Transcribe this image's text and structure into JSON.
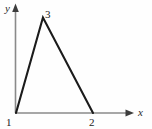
{
  "figure": {
    "background_color": "#fefefe",
    "axis_color": "#8a8a8a",
    "curve_color": "#1b1b1b",
    "label_color": "#222222",
    "axes": {
      "x_axis_label": "x",
      "y_axis_label": "y",
      "x_axis_arrow": "arrow-right",
      "y_axis_arrow": "arrow-up"
    },
    "point_labels": {
      "origin_label": "1",
      "peak_label": "3",
      "right_label": "2"
    }
  },
  "chart_data": {
    "type": "line",
    "title": "",
    "subtitle": "",
    "xlabel": "x",
    "ylabel": "y",
    "grid": false,
    "legend": null,
    "xlim": [
      1,
      2.55
    ],
    "ylim": [
      0,
      3.6
    ],
    "xticks": [
      1,
      2
    ],
    "xticklabels": [
      "1",
      "2"
    ],
    "yticks": [],
    "yticklabels": [],
    "series": [
      {
        "name": "piecewise-linear-triangle",
        "x": [
          1,
          1.35,
          2
        ],
        "y": [
          0,
          3,
          0
        ]
      }
    ],
    "annotations": [
      {
        "text": "3",
        "x": 1.35,
        "y": 3,
        "position": "above-right"
      },
      {
        "text": "1",
        "x": 1,
        "y": 0,
        "position": "below-left"
      },
      {
        "text": "2",
        "x": 2,
        "y": 0,
        "position": "below"
      }
    ]
  }
}
